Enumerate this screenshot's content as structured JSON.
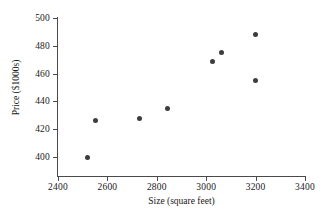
{
  "chart_data": {
    "type": "scatter",
    "title": "",
    "xlabel": "Size (square feet)",
    "ylabel": "Price ($1000s)",
    "xlim": [
      2400,
      3400
    ],
    "ylim": [
      400,
      500
    ],
    "xticks": [
      2400,
      2600,
      2800,
      3000,
      3200,
      3400
    ],
    "yticks": [
      400,
      420,
      440,
      460,
      480,
      500
    ],
    "xtick_labels": [
      "2400",
      "2600",
      "2800",
      "3000",
      "3200",
      "3400"
    ],
    "ytick_labels": [
      "400",
      "420",
      "440",
      "460",
      "480",
      "500"
    ],
    "grid": false,
    "legend": null,
    "marker_color": "#3d3d3d",
    "axis_color": "#4a4a4a",
    "points": [
      {
        "x": 2520,
        "y": 400
      },
      {
        "x": 2550,
        "y": 426
      },
      {
        "x": 2730,
        "y": 428
      },
      {
        "x": 2845,
        "y": 435
      },
      {
        "x": 3025,
        "y": 469
      },
      {
        "x": 3060,
        "y": 475
      },
      {
        "x": 3200,
        "y": 488
      },
      {
        "x": 3200,
        "y": 455
      }
    ]
  }
}
